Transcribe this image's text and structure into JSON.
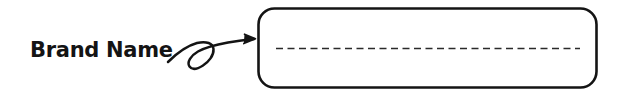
{
  "canvas": {
    "width": 620,
    "height": 95,
    "background": "#ffffff",
    "ink_color": "#141414"
  },
  "annotation": {
    "label": "Brand Name",
    "label_name": "brand-name-label",
    "pointer_icon": "curly-arrow-icon",
    "pointer_direction": "right"
  },
  "field": {
    "box_name": "brand-name-input-box",
    "shape": "rounded-rectangle",
    "corner_radius": 16,
    "border_color": "#141414",
    "border_width": 2.6,
    "fill": "#ffffff",
    "value": "",
    "placeholder": "",
    "guide_line": {
      "name": "dashed-guide-line",
      "style": "dashed",
      "color": "#2a2a2a",
      "dash": "7 4.5",
      "thickness": 1.7
    }
  }
}
